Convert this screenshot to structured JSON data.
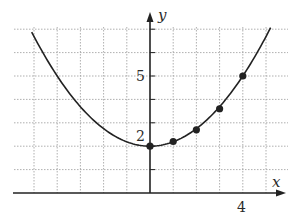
{
  "chart_data": {
    "type": "line",
    "title": "",
    "xlabel": "x",
    "ylabel": "y",
    "xlim": [
      -5,
      5
    ],
    "ylim": [
      0,
      7
    ],
    "grid": true,
    "grid_style": "dotted",
    "tick_labels": {
      "x": [
        {
          "value": 4,
          "label": "4"
        }
      ],
      "y": [
        {
          "value": 2,
          "label": "2"
        },
        {
          "value": 5,
          "label": "5"
        }
      ]
    },
    "curve": {
      "description": "upward-opening parabola with vertex at (0, 2)",
      "function": "y = 3x^2/16 + 2",
      "x_range": [
        -5.1,
        5.2
      ]
    },
    "series": [
      {
        "name": "marked points",
        "x": [
          0,
          1,
          2,
          3,
          4
        ],
        "y": [
          2,
          2.2,
          2.7,
          3.6,
          5
        ]
      }
    ]
  },
  "labels": {
    "x_axis": "x",
    "y_axis": "y",
    "tick_x4": "4",
    "tick_y2": "2",
    "tick_y5": "5"
  },
  "colors": {
    "ink": "#222222",
    "grid": "#9a9a9a"
  }
}
